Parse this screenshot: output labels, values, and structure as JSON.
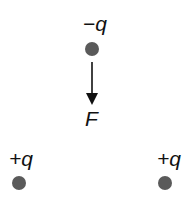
{
  "diagram": {
    "type": "electrostatic-force",
    "charges": [
      {
        "id": "top",
        "label": "−q",
        "sign": "negative",
        "position": "top-center"
      },
      {
        "id": "bottom-left",
        "label": "+q",
        "sign": "positive",
        "position": "bottom-left"
      },
      {
        "id": "bottom-right",
        "label": "+q",
        "sign": "positive",
        "position": "bottom-right"
      }
    ],
    "force": {
      "label": "F",
      "direction": "down",
      "acts_on": "top"
    },
    "colors": {
      "charge_fill": "#5a5a5a",
      "text": "#111111",
      "arrow": "#111111"
    }
  }
}
